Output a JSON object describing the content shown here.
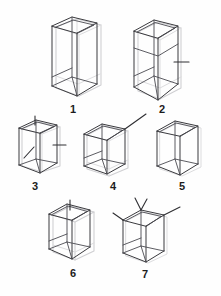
{
  "page": {
    "background_color": "#ffffff",
    "stroke_color": "#3a3a3e",
    "ghost_color": "#cfcfd2",
    "label_color": "#1c1c1c",
    "width": 221,
    "height": 296
  },
  "figures": [
    {
      "id": 1,
      "label": "1",
      "shape": "tall-rectangular-box",
      "proportion": "tall",
      "markers": [],
      "notes": "Tall upright open box, wireframe with visible back edges, light grey ghost outline offset to the right."
    },
    {
      "id": 2,
      "label": "2",
      "shape": "rectangular-box",
      "proportion": "tall",
      "markers": [
        "right-horizontal-tick"
      ],
      "notes": "Upright box with a short horizontal tick protruding from the middle of the right vertical edge."
    },
    {
      "id": 3,
      "label": "3",
      "shape": "rectangular-box",
      "proportion": "upright",
      "markers": [
        "top-vertical-tick",
        "front-face-diagonal-slash",
        "right-horizontal-tick"
      ],
      "notes": "Small upright box with a vertical tick on the top face, a diagonal slash on the front face and a horizontal tick on the right side."
    },
    {
      "id": 4,
      "label": "4",
      "shape": "cube",
      "proportion": "cube",
      "markers": [
        "top-right-diagonal-antenna"
      ],
      "notes": "Cube with a long diagonal line extending up and to the right from the top rear corner."
    },
    {
      "id": 5,
      "label": "5",
      "shape": "rectangular-box",
      "proportion": "upright",
      "markers": [],
      "notes": "Plain upright box with no protruding marks."
    },
    {
      "id": 6,
      "label": "6",
      "shape": "cube",
      "proportion": "cube",
      "markers": [
        "top-vertical-tick"
      ],
      "notes": "Cube with a short vertical tick rising from the top face, heavy ghost outline."
    },
    {
      "id": 7,
      "label": "7",
      "shape": "cube",
      "proportion": "cube",
      "markers": [
        "top-left-v-antenna",
        "top-left-side-tick",
        "top-right-diagonal-tick"
      ],
      "notes": "Cube with a V-shaped antenna at the top-left corner and a diagonal tick from the top-right corner."
    }
  ]
}
